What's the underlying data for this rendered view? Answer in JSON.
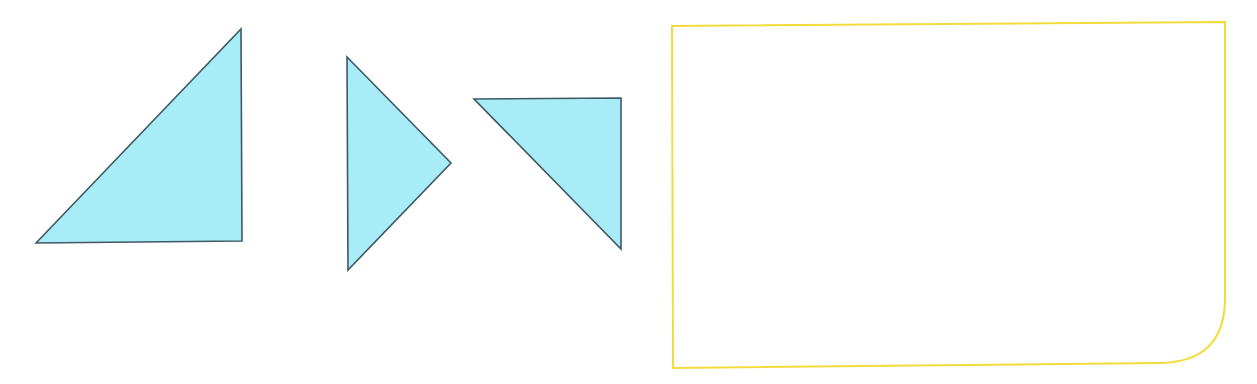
{
  "diagram": {
    "width": 1257,
    "height": 384,
    "background": "#ffffff",
    "colors": {
      "triangle_fill": "#a8ecf7",
      "triangle_stroke": "#3e5866",
      "frame_stroke": "#f2dc3c"
    },
    "triangles": [
      {
        "name": "triangle-right-angle-bottom-right",
        "points": "36,243 241,29 242,241"
      },
      {
        "name": "triangle-pointing-right",
        "points": "347,57 451,163 348,270"
      },
      {
        "name": "triangle-right-angle-top-right",
        "points": "474,99 621,98 621,249"
      }
    ],
    "frame": {
      "name": "rounded-corner-rectangle",
      "path": "M672,26 L1225,22 L1225,298 Q1225,362 1160,363 L673,368 Z"
    }
  }
}
